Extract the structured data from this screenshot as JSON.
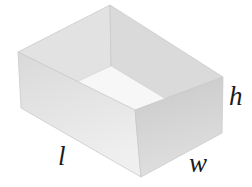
{
  "figure": {
    "type": "open-rectangular-box-diagram",
    "labels": {
      "length": "l",
      "width": "w",
      "height": "h"
    },
    "colors": {
      "background": "#ffffff",
      "inner_left_wall": "#e2e2e2",
      "inner_right_wall": "#dadada",
      "floor": "#f7f7f7",
      "front_left_face_dark": "#d9d9d9",
      "front_left_face_light": "#efefef",
      "front_right_face_dark": "#c9c9c9",
      "front_right_face_light": "#dfdfdf",
      "edge": "#c8c8c8",
      "label_text": "#1b1b1b"
    }
  }
}
